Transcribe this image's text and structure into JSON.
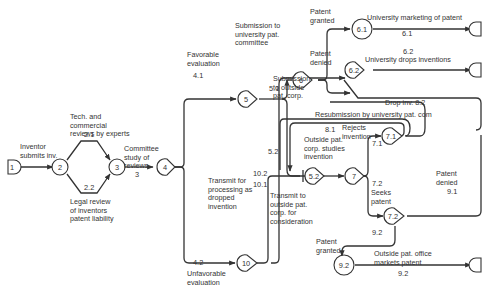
{
  "nodes": {
    "n1": "1",
    "n2": "2",
    "n3": "3",
    "n4": "4",
    "n5": "5",
    "n6": "6",
    "n61": "6.1",
    "n62": "6.2",
    "n52": "5.2",
    "n7": "7",
    "n71": "7.1",
    "n72": "7.2",
    "n10": "10",
    "n92": "9.2"
  },
  "labels": {
    "inventor_submits": "Inventor\nsubmits inv.",
    "tech_reviews": "Tech. and\ncommercial\nreviews by experts",
    "legal_review": "Legal review\nof inventors\npatent liability",
    "committee_study": "Committee\nstudy of\nreviews",
    "favorable": "Favorable\nevaluation",
    "unfavorable": "Unfavorable\nevaluation",
    "submission_univ": "Submission to\nuniversity pat.\ncommittee",
    "submission_outside": "Submission\nto outside\npat. corp.",
    "patent_granted_top": "Patent\ngranted",
    "patent_denied_top": "Patent\ndenied",
    "univ_marketing": "University marketing of patent",
    "univ_drops": "University drops inventions",
    "drop_inv": "Drop inv. 8.2",
    "resubmission": "Resubmission by university pat. com",
    "rejects_invention": "Rejects\ninvention",
    "outside_studies": "Outside pat.\ncorp. studies\ninvention",
    "transmit_dropped": "Transmit for\nprocessing as\ndropped\ninvention",
    "transmit_outside": "Transmit to\noutside pat.\ncorp. for\nconsideration",
    "seeks_patent": "Seeks\npatent",
    "patent_denied_bottom": "Patent\ndenied",
    "patent_granted_bottom": "Patent\ngranted",
    "outside_markets": "Outside pat. office\nmarkets patent"
  },
  "edge_numbers": {
    "e21": "2.1",
    "e22": "2.2",
    "e3": "3",
    "e41": "4.1",
    "e42": "4.2",
    "e51": "5.1",
    "e52": "5.2",
    "e61": "6.1",
    "e62": "6.2",
    "e81": "8.1",
    "e71": "7.1",
    "e72": "7.2",
    "e91": "9.1",
    "e92a": "9.2",
    "e92b": "9.2",
    "e102": "10.2",
    "e101": "10.1"
  }
}
